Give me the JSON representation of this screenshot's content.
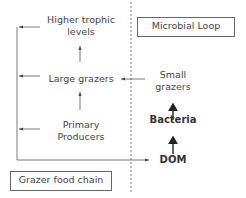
{
  "diagram": {
    "left_title": "Grazer food chain",
    "right_title": "Microbial Loop",
    "grazer_chain": {
      "higher": "Higher trophic levels",
      "higher_line1": "Higher trophic",
      "higher_line2": "levels",
      "large": "Large grazers",
      "primary_line1": "Primary",
      "primary_line2": "Producers"
    },
    "microbial_loop": {
      "small_line1": "Small",
      "small_line2": "grazers",
      "bacteria": "Bacteria",
      "dom": "DOM"
    },
    "edges": [
      {
        "from": "Primary Producers",
        "to": "Large grazers"
      },
      {
        "from": "Large grazers",
        "to": "Higher trophic levels"
      },
      {
        "from": "DOM",
        "to": "Bacteria"
      },
      {
        "from": "Bacteria",
        "to": "Small grazers"
      },
      {
        "from": "Small grazers",
        "to": "Large grazers"
      },
      {
        "from": "Higher trophic levels",
        "to": "DOM"
      },
      {
        "from": "Large grazers",
        "to": "DOM"
      },
      {
        "from": "Primary Producers",
        "to": "DOM"
      }
    ]
  }
}
